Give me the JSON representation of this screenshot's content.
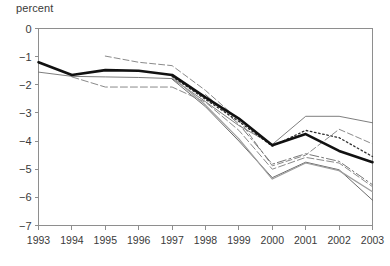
{
  "chart_data": {
    "type": "line",
    "title": "",
    "subtitle": "",
    "xlabel": "",
    "ylabel": "percent",
    "ylabel_position": "top-left",
    "grid": false,
    "legend": "none",
    "x": [
      1993,
      1994,
      1995,
      1996,
      1997,
      1998,
      1999,
      2000,
      2001,
      2002,
      2003
    ],
    "xtick_labels": [
      "1993",
      "1994",
      "1995",
      "1996",
      "1997",
      "1998",
      "1999",
      "2000",
      "2001",
      "2002",
      "2003"
    ],
    "ytick_labels": [
      "0",
      "−1",
      "−2",
      "−3",
      "−4",
      "−5",
      "−6",
      "−7"
    ],
    "ytick_values": [
      0,
      -1,
      -2,
      -3,
      -4,
      -5,
      -6,
      -7
    ],
    "xlim": [
      1993,
      2003
    ],
    "ylim": [
      -7,
      0
    ],
    "series": [
      {
        "name": "actual-outturn",
        "style": "solid-thick-black",
        "color": "#111111",
        "width": 2.6,
        "dash": "none",
        "x": [
          1993,
          1994,
          1995,
          1996,
          1997,
          1998,
          1999,
          2000,
          2001,
          2002,
          2003
        ],
        "values": [
          -1.2,
          -1.65,
          -1.48,
          -1.5,
          -1.65,
          -2.45,
          -3.2,
          -4.15,
          -3.75,
          -4.35,
          -4.75
        ]
      },
      {
        "name": "projection-vintage-a",
        "style": "solid-thin-gray",
        "color": "#6f6f6f",
        "width": 0.9,
        "dash": "none",
        "x": [
          1993,
          1994,
          1995,
          1996,
          1997,
          1998,
          1999,
          2000,
          2001,
          2002,
          2003
        ],
        "values": [
          -1.55,
          -1.7,
          -1.72,
          -1.74,
          -1.78,
          -2.6,
          -3.45,
          -4.12,
          -3.12,
          -3.12,
          -3.35
        ]
      },
      {
        "name": "projection-vintage-b",
        "style": "dashed-upper",
        "color": "#8a8a8a",
        "width": 1.0,
        "dash": "6,3",
        "x": [
          1995,
          1996,
          1997,
          1998,
          1999,
          2000,
          2001,
          2002,
          2003
        ],
        "values": [
          -0.98,
          -1.2,
          -1.32,
          -2.2,
          -3.25,
          -4.88,
          -4.5,
          -3.58,
          -4.1
        ]
      },
      {
        "name": "projection-vintage-c",
        "style": "dashed-lower",
        "color": "#8a8a8a",
        "width": 1.0,
        "dash": "7,3",
        "x": [
          1994,
          1995,
          1996,
          1997,
          1998,
          1999,
          2000,
          2001,
          2002,
          2003
        ],
        "values": [
          -1.72,
          -2.08,
          -2.08,
          -2.08,
          -2.62,
          -3.62,
          -5.0,
          -4.58,
          -4.78,
          -5.62
        ]
      },
      {
        "name": "projection-vintage-d",
        "style": "dotted",
        "color": "#2f2f2f",
        "width": 1.3,
        "dash": "1.6,2.6",
        "x": [
          1997,
          1998,
          1999,
          2000,
          2001,
          2002,
          2003
        ],
        "values": [
          -1.7,
          -2.52,
          -3.3,
          -4.18,
          -3.62,
          -3.88,
          -4.55
        ]
      },
      {
        "name": "projection-vintage-e",
        "style": "solid-thin-lightgray",
        "color": "#9d9d9d",
        "width": 1.2,
        "dash": "none",
        "x": [
          1997,
          1998,
          1999,
          2000,
          2001,
          2002,
          2003
        ],
        "values": [
          -1.72,
          -2.72,
          -3.92,
          -5.35,
          -4.78,
          -5.05,
          -5.8
        ]
      },
      {
        "name": "projection-vintage-f",
        "style": "solid-thin-dark",
        "color": "#5a5a5a",
        "width": 0.9,
        "dash": "none",
        "x": [
          1997,
          1998,
          1999,
          2000,
          2001,
          2002,
          2003
        ],
        "values": [
          -1.8,
          -2.78,
          -4.0,
          -5.3,
          -4.75,
          -5.02,
          -6.1
        ]
      },
      {
        "name": "projection-vintage-g",
        "style": "dash-dot",
        "color": "#777777",
        "width": 1.0,
        "dash": "9,3,2,3",
        "x": [
          1998,
          1999,
          2000,
          2001,
          2002,
          2003
        ],
        "values": [
          -2.35,
          -3.4,
          -4.82,
          -4.45,
          -4.72,
          -5.55
        ]
      }
    ]
  },
  "axes": {
    "y_axis_name": "percent",
    "x_axis_name": ""
  }
}
